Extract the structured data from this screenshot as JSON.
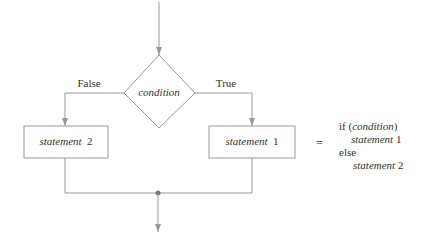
{
  "diagram": {
    "type": "flowchart",
    "decision": {
      "label": "condition"
    },
    "branches": {
      "false_label": "False",
      "true_label": "True"
    },
    "boxes": {
      "left": {
        "word": "statement",
        "num": "2"
      },
      "right": {
        "word": "statement",
        "num": "1"
      }
    },
    "equals": "=",
    "code": {
      "line1_kw": "if (",
      "line1_cond": "condition",
      "line1_close": ")",
      "line2_word": "statement",
      "line2_num": "1",
      "line3": "else",
      "line4_word": "statement",
      "line4_num": "2"
    },
    "colors": {
      "stroke": "#999999",
      "text": "#333333",
      "dot": "#777777"
    }
  }
}
